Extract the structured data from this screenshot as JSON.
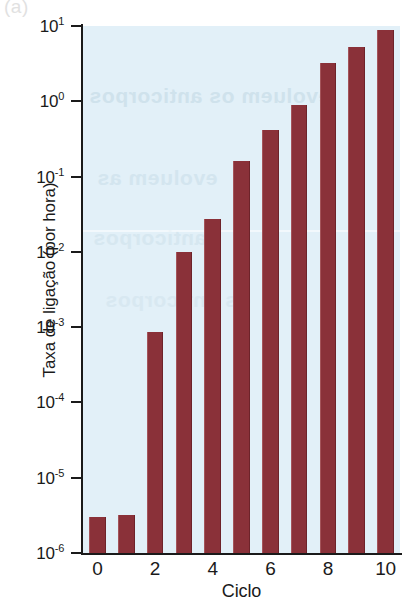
{
  "figure": {
    "panel_letter": "(a)",
    "ghost_text": {
      "line1": "evoluem os anticorpos",
      "line2": "evoluem as",
      "line3": "anticorpos",
      "line4": "os anticorpos"
    }
  },
  "colors": {
    "bar": "#8a3139",
    "bar_edge_light": "#a4545a",
    "bar_edge_dark": "#6d232a",
    "plot_background": "#e2f0f8",
    "axis": "#1a1a1a",
    "page_background": "#ffffff"
  },
  "chart_data": {
    "type": "bar",
    "title": "",
    "xlabel": "Ciclo",
    "ylabel": "Taxa de ligação (por hora)",
    "yscale": "log",
    "ylim": [
      1e-06,
      10
    ],
    "grid": false,
    "legend": "none",
    "categories": [
      "0",
      "1",
      "2",
      "3",
      "4",
      "5",
      "6",
      "7",
      "8",
      "9",
      "10"
    ],
    "values": [
      3e-06,
      3.2e-06,
      0.00085,
      0.01,
      0.027,
      0.16,
      0.42,
      0.9,
      3.2,
      5.2,
      8.8
    ],
    "xtick_labels": [
      "0",
      "2",
      "4",
      "6",
      "8",
      "10"
    ],
    "xtick_positions": [
      0,
      2,
      4,
      6,
      8,
      10
    ],
    "ytick_exponents": [
      1,
      0,
      -1,
      -2,
      -3,
      -4,
      -5,
      -6
    ],
    "ytick_labels": [
      "10",
      "10",
      "10",
      "10",
      "10",
      "10",
      "10",
      "10"
    ],
    "ytick_sup": [
      "1",
      "0",
      "-1",
      "-2",
      "-3",
      "-4",
      "-5",
      "-6"
    ]
  }
}
